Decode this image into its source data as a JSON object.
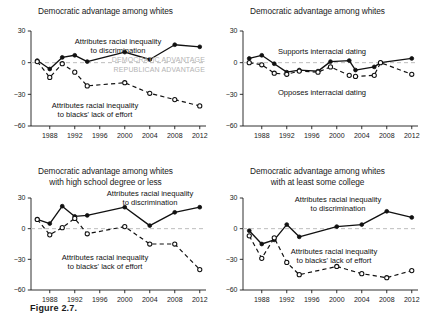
{
  "figure": {
    "caption": "Figure 2.7.",
    "xticks": [
      "1988",
      "1992",
      "1996",
      "2000",
      "2004",
      "2008",
      "2012"
    ],
    "yticks": [
      "30",
      "0",
      "-30",
      "-60"
    ]
  },
  "chart_data": [
    {
      "id": "panel-top-left",
      "type": "line",
      "title": "Democratic advantage among whites",
      "subtitle": "",
      "xlabel": "",
      "ylabel": "",
      "xlim": [
        1985,
        2013
      ],
      "ylim": [
        -60,
        30
      ],
      "xticks": [
        1988,
        1992,
        1996,
        2000,
        2004,
        2008,
        2012
      ],
      "yticks": [
        30,
        0,
        -30,
        -60
      ],
      "grid": false,
      "zero_reference_line": 0,
      "annotations": [
        {
          "text": "Attributes racial inequality to discrimination",
          "line1": "Attributes racial inequality",
          "line2": "to discrimination"
        },
        {
          "text": "Attributes racial inequality to blacks' lack of effort",
          "line1": "Attributes racial inequality",
          "line2": "to blacks' lack of effort"
        },
        {
          "text": "DEMOCRATIC ADVANTAGE"
        },
        {
          "text": "REPUBLICAN ADVANTAGE"
        }
      ],
      "series": [
        {
          "name": "Attributes racial inequality to discrimination",
          "marker": "filled-circle",
          "line": "solid",
          "x": [
            1986,
            1988,
            1990,
            1992,
            1994,
            2000,
            2004,
            2008,
            2012
          ],
          "values": [
            2,
            -6,
            5,
            7,
            1,
            10,
            3,
            17,
            15
          ]
        },
        {
          "name": "Attributes racial inequality to blacks' lack of effort",
          "marker": "open-circle",
          "line": "dashed",
          "x": [
            1986,
            1988,
            1990,
            1992,
            1994,
            2000,
            2004,
            2008,
            2012
          ],
          "values": [
            1,
            -14,
            -1,
            -9,
            -22,
            -19,
            -29,
            -35,
            -41
          ]
        }
      ]
    },
    {
      "id": "panel-top-right",
      "type": "line",
      "title": "Democratic advantage among whites",
      "subtitle": "",
      "xlabel": "",
      "ylabel": "",
      "xlim": [
        1985,
        2013
      ],
      "ylim": [
        -60,
        30
      ],
      "xticks": [
        1988,
        1992,
        1996,
        2000,
        2004,
        2008,
        2012
      ],
      "yticks": [
        30,
        0,
        -30,
        -60
      ],
      "grid": false,
      "zero_reference_line": 0,
      "annotations": [
        {
          "text": "Supports interracial dating"
        },
        {
          "text": "Opposes interracial dating"
        }
      ],
      "series": [
        {
          "name": "Supports interracial dating",
          "marker": "filled-circle",
          "line": "solid",
          "x": [
            1986,
            1988,
            1990,
            1992,
            1994,
            1997,
            1999,
            2002,
            2003,
            2006,
            2007,
            2012
          ],
          "values": [
            4,
            7,
            -1,
            -9,
            -7,
            -8,
            1,
            2,
            -7,
            -4,
            0,
            4,
            -7
          ]
        },
        {
          "name": "Opposes interracial dating",
          "marker": "open-circle",
          "line": "dashed",
          "x": [
            1986,
            1988,
            1990,
            1992,
            1994,
            1997,
            1999,
            2002,
            2003,
            2006,
            2007,
            2012
          ],
          "values": [
            0,
            -2,
            -10,
            -11,
            -8,
            -9,
            -4,
            -12,
            -13,
            -12,
            0,
            -11,
            -45
          ]
        }
      ]
    },
    {
      "id": "panel-bottom-left",
      "type": "line",
      "title": "Democratic advantage among whites",
      "subtitle": "with high school degree or less",
      "xlabel": "",
      "ylabel": "",
      "xlim": [
        1985,
        2013
      ],
      "ylim": [
        -60,
        30
      ],
      "xticks": [
        1988,
        1992,
        1996,
        2000,
        2004,
        2008,
        2012
      ],
      "yticks": [
        30,
        0,
        -30,
        -60
      ],
      "grid": false,
      "zero_reference_line": 0,
      "annotations": [
        {
          "text": "Attributes racial inequality to discrimination",
          "line1": "Attributes racial inequality",
          "line2": "to discrimination"
        },
        {
          "text": "Attributes racial inequality to blacks' lack of effort",
          "line1": "Attributes racial inequality",
          "line2": "to blacks' lack of effort"
        }
      ],
      "series": [
        {
          "name": "Attributes racial inequality to discrimination",
          "marker": "filled-circle",
          "line": "solid",
          "x": [
            1986,
            1988,
            1990,
            1992,
            1994,
            2000,
            2004,
            2008,
            2012
          ],
          "values": [
            9,
            5,
            22,
            12,
            13,
            21,
            3,
            16,
            21
          ]
        },
        {
          "name": "Attributes racial inequality to blacks' lack of effort",
          "marker": "open-circle",
          "line": "dashed",
          "x": [
            1986,
            1988,
            1990,
            1992,
            1994,
            2000,
            2004,
            2008,
            2012
          ],
          "values": [
            9,
            -6,
            1,
            10,
            -5,
            2,
            -15,
            -15,
            -40
          ]
        }
      ]
    },
    {
      "id": "panel-bottom-right",
      "type": "line",
      "title": "Democratic advantage among whites",
      "subtitle": "with at least some college",
      "xlabel": "",
      "ylabel": "",
      "xlim": [
        1985,
        2013
      ],
      "ylim": [
        -60,
        30
      ],
      "xticks": [
        1988,
        1992,
        1996,
        2000,
        2004,
        2008,
        2012
      ],
      "yticks": [
        30,
        0,
        -30,
        -60
      ],
      "grid": false,
      "zero_reference_line": 0,
      "annotations": [
        {
          "text": "Attributes racial inequality to discrimination",
          "line1": "Attributes racial inequality",
          "line2": "to discrimination"
        },
        {
          "text": "Attributes racial inequality to blacks' lack of effort",
          "line1": "Attributes racial inequality",
          "line2": "to blacks' lack of effort"
        }
      ],
      "series": [
        {
          "name": "Attributes racial inequality to discrimination",
          "marker": "filled-circle",
          "line": "solid",
          "x": [
            1986,
            1988,
            1990,
            1992,
            1994,
            2000,
            2004,
            2008,
            2012
          ],
          "values": [
            -2,
            -15,
            -11,
            4,
            -8,
            2,
            4,
            17,
            11
          ]
        },
        {
          "name": "Attributes racial inequality to blacks' lack of effort",
          "marker": "open-circle",
          "line": "dashed",
          "x": [
            1986,
            1988,
            1990,
            1992,
            1994,
            2000,
            2004,
            2008,
            2012
          ],
          "values": [
            -7,
            -29,
            -9,
            -33,
            -45,
            -37,
            -44,
            -48,
            -41
          ]
        }
      ]
    }
  ]
}
